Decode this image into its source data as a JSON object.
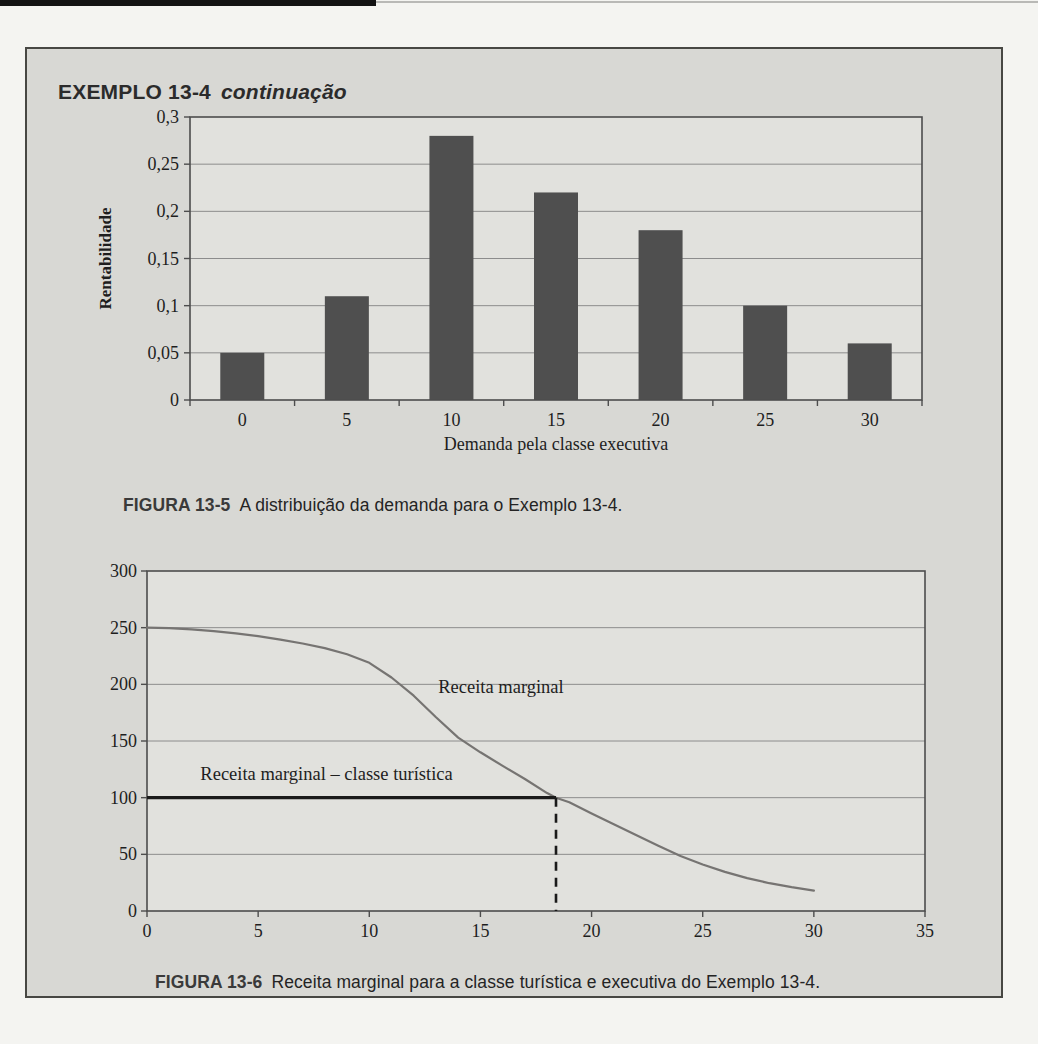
{
  "header": {
    "title": "EXEMPLO 13-4",
    "subtitle": "continuação"
  },
  "figure1_caption": {
    "label": "FIGURA 13-5",
    "text": "A distribuição da demanda para o Exemplo 13-4."
  },
  "figure2_caption": {
    "label": "FIGURA 13-6",
    "text": "Receita marginal para a classe turística e executiva do Exemplo 13-4."
  },
  "colors": {
    "box_bg": "#d8d8d4",
    "plot_bg": "#e1e1dd",
    "grid": "#8c8c8c",
    "frame": "#4d4d4d",
    "bar": "#4f4f4f",
    "curve": "#767472",
    "tourist_line": "#1a1a1a",
    "dashed_line": "#1a1a1a",
    "tick_text": "#1e1e1e"
  },
  "chart_data": [
    {
      "type": "bar",
      "title": "",
      "categories": [
        "0",
        "5",
        "10",
        "15",
        "20",
        "25",
        "30"
      ],
      "values": [
        0.05,
        0.11,
        0.28,
        0.22,
        0.18,
        0.1,
        0.06
      ],
      "xlabel": "Demanda pela classe executiva",
      "ylabel": "Rentabilidade",
      "ylim": [
        0,
        0.3
      ],
      "ytick_values": [
        0,
        0.05,
        0.1,
        0.15,
        0.2,
        0.25,
        0.3
      ],
      "ytick_labels": [
        "0",
        "0,05",
        "0,1",
        "0,15",
        "0,2",
        "0,25",
        "0,3"
      ],
      "grid": true,
      "legend": "none"
    },
    {
      "type": "line",
      "title": "",
      "xlabel": "",
      "ylabel": "",
      "xlim": [
        0,
        35
      ],
      "ylim": [
        0,
        300
      ],
      "xticks": [
        0,
        5,
        10,
        15,
        20,
        25,
        30,
        35
      ],
      "yticks": [
        0,
        50,
        100,
        150,
        200,
        250,
        300
      ],
      "grid": true,
      "legend": "none",
      "series": [
        {
          "name": "Receita marginal",
          "style": "smooth_curve",
          "x": [
            0,
            1,
            2,
            3,
            4,
            5,
            6,
            7,
            8,
            9,
            10,
            11,
            12,
            13,
            14,
            15,
            16,
            17,
            18,
            18.4,
            19,
            20,
            21,
            22,
            23,
            24,
            25,
            26,
            27,
            28,
            29,
            30
          ],
          "y": [
            250,
            249.5,
            248.5,
            247,
            245,
            242.5,
            239.5,
            236,
            232,
            226.5,
            219,
            206,
            190,
            171,
            153,
            140,
            128,
            116.5,
            104,
            100,
            96,
            86,
            76.5,
            67,
            57.5,
            48.5,
            41,
            34.5,
            29,
            24.5,
            21,
            18
          ]
        },
        {
          "name": "Receita marginal – classe turística",
          "style": "thick_horizontal",
          "x": [
            0,
            18.4
          ],
          "y": [
            100,
            100
          ]
        }
      ],
      "dashed_vline": {
        "x": 18.4,
        "y0": 0,
        "y1": 100
      },
      "annotations": [
        {
          "text": "Receita marginal",
          "x": 13.1,
          "y": 192
        },
        {
          "text": "Receita marginal – classe turística",
          "x": 2.4,
          "y": 116
        }
      ]
    }
  ]
}
